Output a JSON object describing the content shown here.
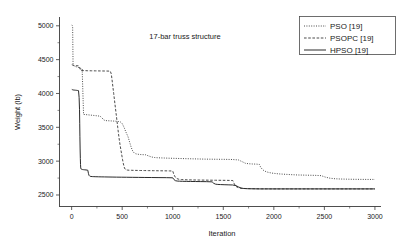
{
  "chart_data": {
    "type": "line",
    "title": "17-bar truss structure",
    "xlabel": "Iteration",
    "ylabel": "Weight (lb)",
    "xlim": [
      -120,
      3060
    ],
    "ylim": [
      2330,
      5130
    ],
    "xticks": [
      0,
      500,
      1000,
      1500,
      2000,
      2500,
      3000
    ],
    "xticklabels": [
      "0",
      "500",
      "1000",
      "1500",
      "2000",
      "2500",
      "3000"
    ],
    "yticks": [
      2500,
      3000,
      3500,
      4000,
      4500,
      5000
    ],
    "yticklabels": [
      "2500",
      "3000",
      "3500",
      "4000",
      "4500",
      "5000"
    ],
    "yminorticks": [
      2750,
      3250,
      3750,
      4250,
      4750
    ],
    "grid": false,
    "legend_position": "top-right",
    "series": [
      {
        "name": "PSO [19]",
        "style": "dotted",
        "points": [
          [
            2,
            5010
          ],
          [
            6,
            5005
          ],
          [
            10,
            4990
          ],
          [
            14,
            4430
          ],
          [
            20,
            4410
          ],
          [
            26,
            4405
          ],
          [
            34,
            4400
          ],
          [
            44,
            4395
          ],
          [
            55,
            4390
          ],
          [
            66,
            4385
          ],
          [
            78,
            4378
          ],
          [
            90,
            4372
          ],
          [
            104,
            4366
          ],
          [
            118,
            3690
          ],
          [
            140,
            3688
          ],
          [
            165,
            3684
          ],
          [
            190,
            3680
          ],
          [
            215,
            3676
          ],
          [
            240,
            3672
          ],
          [
            262,
            3668
          ],
          [
            282,
            3664
          ],
          [
            300,
            3640
          ],
          [
            316,
            3612
          ],
          [
            330,
            3600
          ],
          [
            350,
            3598
          ],
          [
            372,
            3596
          ],
          [
            395,
            3594
          ],
          [
            418,
            3592
          ],
          [
            440,
            3590
          ],
          [
            462,
            3586
          ],
          [
            482,
            3580
          ],
          [
            498,
            3560
          ],
          [
            512,
            3520
          ],
          [
            524,
            3480
          ],
          [
            534,
            3440
          ],
          [
            546,
            3400
          ],
          [
            558,
            3360
          ],
          [
            568,
            3310
          ],
          [
            578,
            3260
          ],
          [
            588,
            3210
          ],
          [
            598,
            3170
          ],
          [
            608,
            3140
          ],
          [
            620,
            3120
          ],
          [
            636,
            3108
          ],
          [
            656,
            3102
          ],
          [
            680,
            3098
          ],
          [
            706,
            3096
          ],
          [
            732,
            3094
          ],
          [
            760,
            3078
          ],
          [
            790,
            3062
          ],
          [
            820,
            3054
          ],
          [
            852,
            3050
          ],
          [
            886,
            3048
          ],
          [
            920,
            3046
          ],
          [
            958,
            3044
          ],
          [
            1000,
            3042
          ],
          [
            1048,
            3040
          ],
          [
            1098,
            3038
          ],
          [
            1150,
            3036
          ],
          [
            1204,
            3034
          ],
          [
            1260,
            3032
          ],
          [
            1316,
            3030
          ],
          [
            1372,
            3029
          ],
          [
            1428,
            3028
          ],
          [
            1484,
            3027
          ],
          [
            1540,
            3026
          ],
          [
            1596,
            3024
          ],
          [
            1650,
            3018
          ],
          [
            1690,
            2990
          ],
          [
            1720,
            2968
          ],
          [
            1750,
            2962
          ],
          [
            1790,
            2958
          ],
          [
            1830,
            2956
          ],
          [
            1856,
            2952
          ],
          [
            1870,
            2910
          ],
          [
            1888,
            2876
          ],
          [
            1906,
            2856
          ],
          [
            1928,
            2842
          ],
          [
            1952,
            2832
          ],
          [
            1980,
            2824
          ],
          [
            2012,
            2818
          ],
          [
            2048,
            2812
          ],
          [
            2088,
            2808
          ],
          [
            2132,
            2804
          ],
          [
            2180,
            2800
          ],
          [
            2232,
            2796
          ],
          [
            2288,
            2794
          ],
          [
            2348,
            2792
          ],
          [
            2410,
            2790
          ],
          [
            2468,
            2786
          ],
          [
            2510,
            2764
          ],
          [
            2556,
            2748
          ],
          [
            2606,
            2740
          ],
          [
            2660,
            2736
          ],
          [
            2718,
            2734
          ],
          [
            2780,
            2732
          ],
          [
            2846,
            2731
          ],
          [
            2914,
            2730
          ],
          [
            2980,
            2730
          ],
          [
            3000,
            2730
          ]
        ]
      },
      {
        "name": "PSOPC [19]",
        "style": "dashed",
        "points": [
          [
            2,
            4425
          ],
          [
            10,
            4420
          ],
          [
            22,
            4415
          ],
          [
            36,
            4412
          ],
          [
            52,
            4410
          ],
          [
            70,
            4408
          ],
          [
            90,
            4340
          ],
          [
            120,
            4338
          ],
          [
            155,
            4336
          ],
          [
            195,
            4335
          ],
          [
            238,
            4334
          ],
          [
            282,
            4333
          ],
          [
            328,
            4332
          ],
          [
            360,
            4331
          ],
          [
            382,
            4330
          ],
          [
            392,
            4290
          ],
          [
            400,
            4200
          ],
          [
            408,
            4100
          ],
          [
            416,
            4000
          ],
          [
            424,
            3900
          ],
          [
            432,
            3800
          ],
          [
            440,
            3700
          ],
          [
            448,
            3600
          ],
          [
            456,
            3500
          ],
          [
            464,
            3400
          ],
          [
            472,
            3310
          ],
          [
            480,
            3230
          ],
          [
            488,
            3160
          ],
          [
            496,
            3090
          ],
          [
            504,
            3020
          ],
          [
            512,
            2960
          ],
          [
            520,
            2912
          ],
          [
            528,
            2884
          ],
          [
            538,
            2872
          ],
          [
            552,
            2868
          ],
          [
            570,
            2866
          ],
          [
            592,
            2865
          ],
          [
            618,
            2864
          ],
          [
            648,
            2863
          ],
          [
            682,
            2862
          ],
          [
            720,
            2861
          ],
          [
            762,
            2860
          ],
          [
            808,
            2859
          ],
          [
            858,
            2858
          ],
          [
            912,
            2857
          ],
          [
            968,
            2856
          ],
          [
            1000,
            2854
          ],
          [
            1012,
            2800
          ],
          [
            1026,
            2762
          ],
          [
            1042,
            2742
          ],
          [
            1062,
            2732
          ],
          [
            1086,
            2728
          ],
          [
            1114,
            2726
          ],
          [
            1146,
            2724
          ],
          [
            1182,
            2723
          ],
          [
            1222,
            2722
          ],
          [
            1266,
            2721
          ],
          [
            1314,
            2720
          ],
          [
            1366,
            2719
          ],
          [
            1422,
            2718
          ],
          [
            1482,
            2717
          ],
          [
            1546,
            2716
          ],
          [
            1594,
            2714
          ],
          [
            1608,
            2668
          ],
          [
            1622,
            2632
          ],
          [
            1640,
            2612
          ],
          [
            1662,
            2602
          ],
          [
            1688,
            2598
          ],
          [
            1718,
            2596
          ],
          [
            1752,
            2594
          ],
          [
            1790,
            2593
          ],
          [
            1832,
            2592
          ],
          [
            1878,
            2591
          ],
          [
            1928,
            2591
          ],
          [
            1982,
            2590
          ],
          [
            2040,
            2590
          ],
          [
            2102,
            2590
          ],
          [
            2168,
            2590
          ],
          [
            2238,
            2590
          ],
          [
            2312,
            2590
          ],
          [
            2390,
            2590
          ],
          [
            2472,
            2590
          ],
          [
            2558,
            2590
          ],
          [
            2648,
            2590
          ],
          [
            2742,
            2590
          ],
          [
            2840,
            2590
          ],
          [
            2942,
            2590
          ],
          [
            3000,
            2590
          ]
        ]
      },
      {
        "name": "HPSO [19]",
        "style": "solid",
        "points": [
          [
            2,
            4060
          ],
          [
            8,
            4056
          ],
          [
            16,
            4052
          ],
          [
            26,
            4050
          ],
          [
            38,
            4048
          ],
          [
            50,
            4046
          ],
          [
            60,
            4044
          ],
          [
            68,
            4042
          ],
          [
            74,
            3940
          ],
          [
            78,
            3760
          ],
          [
            80,
            3560
          ],
          [
            82,
            3360
          ],
          [
            84,
            3180
          ],
          [
            86,
            3040
          ],
          [
            88,
            2950
          ],
          [
            90,
            2900
          ],
          [
            94,
            2884
          ],
          [
            100,
            2878
          ],
          [
            108,
            2876
          ],
          [
            118,
            2874
          ],
          [
            130,
            2872
          ],
          [
            142,
            2870
          ],
          [
            152,
            2868
          ],
          [
            160,
            2866
          ],
          [
            166,
            2820
          ],
          [
            172,
            2790
          ],
          [
            180,
            2778
          ],
          [
            190,
            2774
          ],
          [
            204,
            2772
          ],
          [
            220,
            2771
          ],
          [
            240,
            2770
          ],
          [
            264,
            2769
          ],
          [
            292,
            2768
          ],
          [
            324,
            2767
          ],
          [
            360,
            2766
          ],
          [
            400,
            2765
          ],
          [
            444,
            2764
          ],
          [
            492,
            2763
          ],
          [
            544,
            2762
          ],
          [
            600,
            2761
          ],
          [
            660,
            2760
          ],
          [
            724,
            2759
          ],
          [
            792,
            2758
          ],
          [
            864,
            2757
          ],
          [
            940,
            2756
          ],
          [
            1000,
            2754
          ],
          [
            1012,
            2728
          ],
          [
            1026,
            2712
          ],
          [
            1044,
            2706
          ],
          [
            1068,
            2704
          ],
          [
            1098,
            2702
          ],
          [
            1134,
            2701
          ],
          [
            1176,
            2700
          ],
          [
            1224,
            2699
          ],
          [
            1278,
            2698
          ],
          [
            1336,
            2697
          ],
          [
            1390,
            2694
          ],
          [
            1406,
            2672
          ],
          [
            1424,
            2660
          ],
          [
            1446,
            2656
          ],
          [
            1474,
            2654
          ],
          [
            1508,
            2652
          ],
          [
            1548,
            2650
          ],
          [
            1592,
            2648
          ],
          [
            1626,
            2638
          ],
          [
            1652,
            2618
          ],
          [
            1676,
            2602
          ],
          [
            1704,
            2596
          ],
          [
            1736,
            2593
          ],
          [
            1772,
            2592
          ],
          [
            1812,
            2591
          ],
          [
            1856,
            2590
          ],
          [
            1904,
            2590
          ],
          [
            1956,
            2590
          ],
          [
            2012,
            2590
          ],
          [
            2072,
            2590
          ],
          [
            2136,
            2590
          ],
          [
            2204,
            2590
          ],
          [
            2276,
            2590
          ],
          [
            2352,
            2590
          ],
          [
            2432,
            2590
          ],
          [
            2516,
            2590
          ],
          [
            2604,
            2590
          ],
          [
            2696,
            2590
          ],
          [
            2792,
            2590
          ],
          [
            2892,
            2590
          ],
          [
            2996,
            2590
          ],
          [
            3000,
            2590
          ]
        ]
      }
    ]
  },
  "legend": {
    "entries": [
      {
        "label": "PSO [19]",
        "style": "dotted"
      },
      {
        "label": "PSOPC [19]",
        "style": "dashed"
      },
      {
        "label": "HPSO [19]",
        "style": "solid"
      }
    ]
  }
}
